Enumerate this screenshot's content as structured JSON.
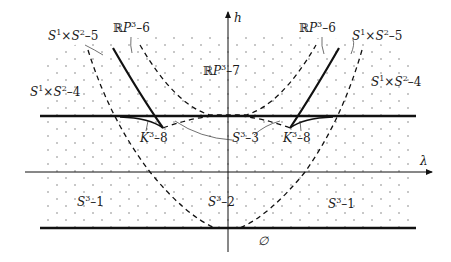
{
  "diagram": {
    "type": "bifurcation-diagram",
    "axes": {
      "horizontal": {
        "label": "λ"
      },
      "vertical": {
        "label": "h"
      }
    },
    "regions": [
      {
        "id": "s1s2-5-left",
        "base": "S",
        "sup1": "1",
        "times": "×",
        "base2": "S",
        "sup2": "2",
        "suffix": "–5"
      },
      {
        "id": "rp3-6-left",
        "prefix": "ℝ",
        "base": "P",
        "sup": "3",
        "suffix": "–6"
      },
      {
        "id": "rp3-6-right",
        "prefix": "ℝ",
        "base": "P",
        "sup": "3",
        "suffix": "–6"
      },
      {
        "id": "s1s2-5-right",
        "base": "S",
        "sup1": "1",
        "times": "×",
        "base2": "S",
        "sup2": "2",
        "suffix": "–5"
      },
      {
        "id": "rp3-7",
        "prefix": "ℝ",
        "base": "P",
        "sup": "3",
        "suffix": "–7"
      },
      {
        "id": "s1s2-4-left",
        "base": "S",
        "sup1": "1",
        "times": "×",
        "base2": "S",
        "sup2": "2",
        "suffix": "–4"
      },
      {
        "id": "s1s2-4-right",
        "base": "S",
        "sup1": "1",
        "times": "×",
        "base2": "S",
        "sup2": "2",
        "suffix": "–4"
      },
      {
        "id": "k3-8-left",
        "base": "K",
        "sup": "3",
        "suffix": "–8"
      },
      {
        "id": "s3-3",
        "base": "S",
        "sup": "3",
        "suffix": "–3"
      },
      {
        "id": "k3-8-right",
        "base": "K",
        "sup": "3",
        "suffix": "–8"
      },
      {
        "id": "s3-1-left",
        "base": "S",
        "sup": "3",
        "suffix": "–1"
      },
      {
        "id": "s3-2",
        "base": "S",
        "sup": "3",
        "suffix": "–2"
      },
      {
        "id": "s3-1-right",
        "base": "S",
        "sup": "3",
        "suffix": "–1"
      },
      {
        "id": "empty-set",
        "symbol": "∅"
      }
    ],
    "colors": {
      "line": "#111111",
      "dots": "#555555",
      "background": "#ffffff"
    }
  }
}
